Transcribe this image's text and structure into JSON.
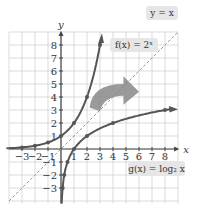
{
  "figure": {
    "axes": {
      "x_label": "x",
      "y_label": "y"
    },
    "x_ticks": [
      "-3",
      "-2",
      "-1",
      "1",
      "2",
      "3",
      "4",
      "5",
      "6",
      "7",
      "8"
    ],
    "y_ticks": [
      "8",
      "7",
      "6",
      "5",
      "4",
      "3",
      "2",
      "1",
      "-1",
      "-2",
      "-3"
    ],
    "labels": {
      "identity": "y = x",
      "exp": "f(x) = 2ˣ",
      "log": "g(x) = log₂ x"
    },
    "colors": {
      "curve": "#555555",
      "identity_line": "#999999",
      "grid": "#cccccc",
      "axis": "#444444",
      "label_box": "#e6e6e6",
      "arrow": "#888888"
    }
  },
  "chart_data": {
    "type": "line",
    "title": "",
    "xlabel": "x",
    "ylabel": "y",
    "xlim": [
      -4,
      9
    ],
    "ylim": [
      -4,
      9
    ],
    "grid": true,
    "series": [
      {
        "name": "f(x) = 2^x",
        "points": [
          [
            -3,
            0.125
          ],
          [
            -2,
            0.25
          ],
          [
            -1,
            0.5
          ],
          [
            0,
            1
          ],
          [
            1,
            2
          ],
          [
            2,
            4
          ],
          [
            3,
            8
          ]
        ]
      },
      {
        "name": "g(x) = log2 x",
        "points": [
          [
            0.125,
            -3
          ],
          [
            0.25,
            -2
          ],
          [
            0.5,
            -1
          ],
          [
            1,
            0
          ],
          [
            2,
            1
          ],
          [
            4,
            2
          ],
          [
            8,
            3
          ]
        ]
      },
      {
        "name": "y = x",
        "style": "dashed",
        "points": [
          [
            -4,
            -4
          ],
          [
            9,
            9
          ]
        ]
      }
    ],
    "annotations": [
      "y = x",
      "f(x) = 2^x",
      "g(x) = log₂ x",
      "curved arrow indicating reflection across y = x"
    ]
  }
}
